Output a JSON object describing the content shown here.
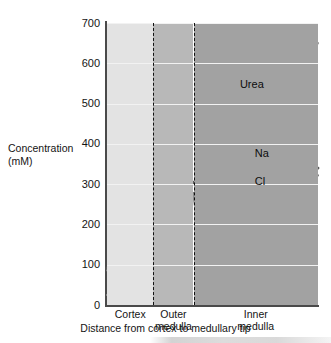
{
  "chart_data": {
    "type": "line",
    "title": "",
    "xlabel": "Distance from cortex to medullary tip",
    "ylabel": "Concentration (mM)",
    "ylabel_line1": "Concentration",
    "ylabel_line2": "(mM)",
    "ylim": [
      0,
      700
    ],
    "yticks": [
      0,
      100,
      200,
      300,
      400,
      500,
      600,
      700
    ],
    "ytick_labels": [
      "0",
      "100",
      "200",
      "300",
      "400",
      "500",
      "600",
      "700"
    ],
    "grid": true,
    "grid_axis": "y",
    "legend": "inline-labels",
    "xlim": [
      0,
      100
    ],
    "x_regions": [
      {
        "name": "Cortex",
        "label_line1": "Cortex",
        "label_line2": "",
        "start": 0,
        "end": 22,
        "color": "#e3e3e3"
      },
      {
        "name": "Outer medulla",
        "label_line1": "Outer",
        "label_line2": "medulla",
        "start": 22,
        "end": 41,
        "color": "#b8b8b8"
      },
      {
        "name": "Inner medulla",
        "label_line1": "Inner",
        "label_line2": "medulla",
        "start": 41,
        "end": 100,
        "color": "#a2a2a2"
      }
    ],
    "region_dividers": [
      22,
      41
    ],
    "series": [
      {
        "name": "Na",
        "label": "Na",
        "color": "#595959",
        "x": [
          0,
          9,
          22,
          41,
          48,
          57,
          74,
          89,
          100
        ],
        "values": [
          92,
          90,
          148,
          305,
          307,
          300,
          320,
          355,
          340
        ]
      },
      {
        "name": "Cl",
        "label": "Cl",
        "color": "#7d7d7d",
        "x": [
          0,
          9,
          22,
          41,
          48,
          57,
          74,
          89,
          100
        ],
        "values": [
          86,
          84,
          142,
          278,
          288,
          292,
          310,
          330,
          322
        ]
      },
      {
        "name": "Urea",
        "label": "Urea",
        "color": "#8e8e8e",
        "x": [
          0,
          12,
          22,
          34,
          37,
          41,
          60,
          80,
          100
        ],
        "values": [
          25,
          28,
          42,
          50,
          128,
          270,
          385,
          515,
          650
        ]
      }
    ]
  },
  "labels": {
    "urea": "Urea",
    "na": "Na",
    "cl": "Cl"
  }
}
